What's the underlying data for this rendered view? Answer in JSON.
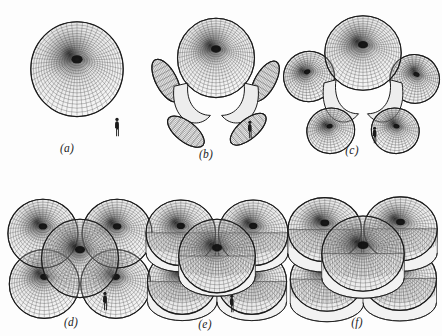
{
  "figure": {
    "background_color": "#fdfdfd",
    "ink_color": "#1b1b1b",
    "mesh_color": "#3a3a3a",
    "shade_light": "#e8e8e8",
    "shade_mid": "#b9b9b9",
    "shade_dark": "#6e6e6e",
    "core_color": "#111111",
    "width": 442,
    "height": 336,
    "columns": 3,
    "rows": 2
  },
  "panels": [
    {
      "id": "a",
      "label": "(a)",
      "kind": "single-dome",
      "lobes": 1,
      "scale_figure": true,
      "x": 10,
      "y": 6,
      "w": 134,
      "h": 158,
      "label_x": 67,
      "label_y": 142,
      "scale_x": 113,
      "scale_y": 117,
      "scale_h": 20
    },
    {
      "id": "b",
      "label": "(b)",
      "kind": "dome-with-petals",
      "lobes": 5,
      "scale_figure": true,
      "x": 146,
      "y": 2,
      "w": 140,
      "h": 162,
      "label_x": 206,
      "label_y": 148,
      "scale_x": 246,
      "scale_y": 120,
      "scale_h": 19
    },
    {
      "id": "c",
      "label": "(c)",
      "kind": "dome-with-shells",
      "lobes": 5,
      "scale_figure": true,
      "x": 288,
      "y": 2,
      "w": 150,
      "h": 162,
      "label_x": 352,
      "label_y": 144,
      "scale_x": 371,
      "scale_y": 126,
      "scale_h": 18
    },
    {
      "id": "d",
      "label": "(d)",
      "kind": "cluster-domes",
      "lobes": 5,
      "scale_figure": true,
      "x": 10,
      "y": 172,
      "w": 140,
      "h": 160,
      "label_x": 71,
      "label_y": 316,
      "scale_x": 101,
      "scale_y": 291,
      "scale_h": 20
    },
    {
      "id": "e",
      "label": "(e)",
      "kind": "cluster-cylinders",
      "lobes": 5,
      "scale_figure": true,
      "x": 146,
      "y": 172,
      "w": 142,
      "h": 160,
      "label_x": 205,
      "label_y": 318,
      "scale_x": 228,
      "scale_y": 294,
      "scale_h": 19
    },
    {
      "id": "f",
      "label": "(f)",
      "kind": "cluster-merged",
      "lobes": 5,
      "scale_figure": false,
      "x": 288,
      "y": 172,
      "w": 150,
      "h": 160,
      "label_x": 357,
      "label_y": 316,
      "scale_x": 0,
      "scale_y": 0,
      "scale_h": 0
    }
  ],
  "scale_marker": {
    "name": "human-figure-scale-marker",
    "description": "tiny standing human silhouette used as a size reference"
  }
}
